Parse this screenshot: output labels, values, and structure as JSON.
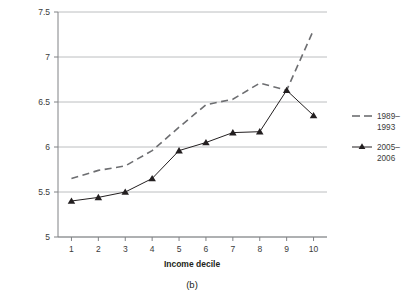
{
  "figure": {
    "caption": "(b)"
  },
  "chart_data": {
    "type": "line",
    "title": "",
    "xlabel": "Income decile",
    "ylabel": "",
    "categories": [
      "1",
      "2",
      "3",
      "4",
      "5",
      "6",
      "7",
      "8",
      "9",
      "10"
    ],
    "x": [
      1,
      2,
      3,
      4,
      5,
      6,
      7,
      8,
      9,
      10
    ],
    "xlim": [
      0.5,
      10.5
    ],
    "ylim": [
      5,
      7.5
    ],
    "yticks": [
      "5",
      "5.5",
      "6",
      "6.5",
      "7",
      "7.5"
    ],
    "ytick_values": [
      5,
      5.5,
      6,
      6.5,
      7,
      7.5
    ],
    "grid": true,
    "grid_axis": "y",
    "legend_position": "right",
    "series": [
      {
        "name": "1989–1993",
        "style": "dashed",
        "marker": "none",
        "color": "#6d6e71",
        "values": [
          5.65,
          5.74,
          5.79,
          5.96,
          6.22,
          6.47,
          6.53,
          6.71,
          6.63,
          7.3
        ]
      },
      {
        "name": "2005–2006",
        "style": "solid",
        "marker": "triangle",
        "color": "#231f20",
        "values": [
          5.4,
          5.44,
          5.5,
          5.65,
          5.96,
          6.05,
          6.16,
          6.17,
          6.63,
          6.35
        ]
      }
    ]
  },
  "colors": {
    "series_1989_1993": "#6d6e71",
    "series_2005_2006": "#231f20",
    "gridline": "#bcbec0",
    "axis": "#808285",
    "background": "#ffffff"
  }
}
